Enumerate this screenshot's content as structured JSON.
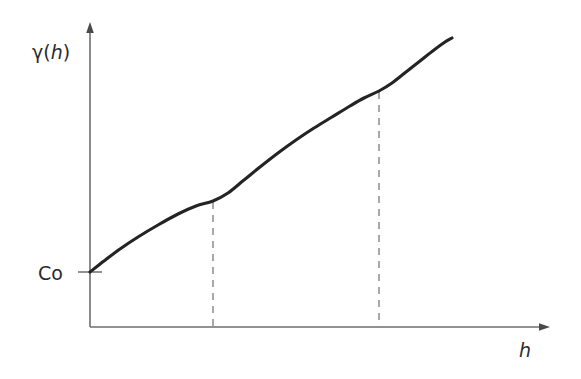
{
  "figure": {
    "background_color": "#ffffff"
  },
  "labels": {
    "y_axis_gamma": "γ",
    "y_axis_paren_open": "(",
    "y_axis_variable": "h",
    "y_axis_paren_close": ")",
    "y_axis_full": "γ(h)",
    "x_axis": "h",
    "nugget": "Co"
  },
  "colors": {
    "curve": "#242424",
    "axis": "#6e6e6e",
    "dashed": "#8c8c8c",
    "text": "#2b2b2b",
    "background": "#ffffff"
  },
  "chart_data": {
    "type": "line",
    "title": "",
    "xlabel": "h",
    "ylabel": "γ(h)",
    "grid": false,
    "legend": null,
    "axes": {
      "x_origin_px": 90,
      "y_origin_px": 327,
      "x_arrow_tip_px": 550,
      "y_arrow_tip_px": 22,
      "x_range_label": "h",
      "y_range_label": "γ(h)"
    },
    "annotations": [
      {
        "name": "nugget-effect",
        "label": "Co",
        "type": "axis-intercept",
        "x_px": 90,
        "y_px": 272,
        "description": "Nugget effect: non-zero intercept of the semivariogram at h = 0"
      },
      {
        "name": "first-range",
        "label": "",
        "type": "vertical-dashed",
        "x_px": 213,
        "y_top_px": 201,
        "y_bottom_px": 327,
        "description": "Range of the first nested structure; curve flattens then rises again"
      },
      {
        "name": "second-range",
        "label": "",
        "type": "vertical-dashed",
        "x_px": 379,
        "y_top_px": 91,
        "y_bottom_px": 327,
        "description": "Range of the second nested structure; slope change in the curve"
      }
    ],
    "series": [
      {
        "name": "semivariogram",
        "points_px": [
          [
            90,
            272
          ],
          [
            104,
            261
          ],
          [
            120,
            249
          ],
          [
            138,
            237
          ],
          [
            158,
            225
          ],
          [
            178,
            214
          ],
          [
            196,
            206
          ],
          [
            213,
            201
          ],
          [
            228,
            193
          ],
          [
            244,
            180
          ],
          [
            260,
            167
          ],
          [
            278,
            153
          ],
          [
            296,
            140
          ],
          [
            314,
            128
          ],
          [
            332,
            117
          ],
          [
            350,
            106
          ],
          [
            364,
            98
          ],
          [
            379,
            91
          ],
          [
            392,
            83
          ],
          [
            406,
            72
          ],
          [
            420,
            61
          ],
          [
            434,
            50
          ],
          [
            445,
            42
          ],
          [
            452,
            38
          ]
        ],
        "description": "Monotonically increasing nested semivariogram starting at the nugget Co, with two range breaks"
      }
    ]
  }
}
